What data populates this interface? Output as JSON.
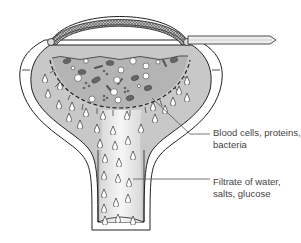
{
  "diagram": {
    "colors": {
      "fill_gray": "#c8c8c8",
      "fill_light": "#eeeeee",
      "outline": "#222222",
      "cell_dark": "#666666",
      "mesh": "#888888"
    },
    "labels": [
      {
        "id": "blood-cells",
        "lines": [
          "Blood cells, proteins,",
          "bacteria"
        ]
      },
      {
        "id": "filtrate",
        "lines": [
          "Filtrate of water,",
          "salts, glucose"
        ]
      }
    ]
  }
}
